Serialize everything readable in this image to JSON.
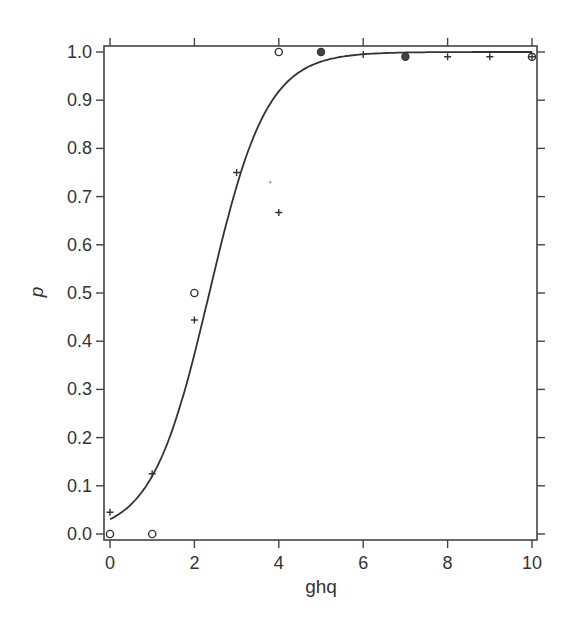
{
  "chart_data": {
    "type": "scatter",
    "title": "",
    "xlabel": "ghq",
    "ylabel": "p",
    "xlim": [
      0,
      10
    ],
    "ylim": [
      0,
      1.0
    ],
    "x_ticks": [
      0,
      2,
      4,
      6,
      8,
      10
    ],
    "x_tick_labels": [
      "0",
      "2",
      "4",
      "6",
      "8",
      "10"
    ],
    "y_ticks": [
      0.0,
      0.1,
      0.2,
      0.3,
      0.4,
      0.5,
      0.6,
      0.7,
      0.8,
      0.9,
      1.0
    ],
    "y_tick_labels": [
      "0.0",
      "0.1",
      "0.2",
      "0.3",
      "0.4",
      "0.5",
      "0.6",
      "0.7",
      "0.8",
      "0.9",
      "1.0"
    ],
    "grid": false,
    "legend": null,
    "series": [
      {
        "name": "observed-circle",
        "marker": "circle-open",
        "points": [
          [
            0,
            0.0
          ],
          [
            1,
            0.0
          ],
          [
            2,
            0.5
          ],
          [
            4,
            1.0
          ],
          [
            10,
            0.99
          ]
        ]
      },
      {
        "name": "observed-plus",
        "marker": "plus",
        "points": [
          [
            0,
            0.045
          ],
          [
            1,
            0.125
          ],
          [
            2,
            0.444
          ],
          [
            3,
            0.75
          ],
          [
            4,
            0.667
          ],
          [
            6,
            0.995
          ],
          [
            8,
            0.99
          ],
          [
            9,
            0.99
          ],
          [
            10,
            0.99
          ]
        ]
      },
      {
        "name": "observed-overlap",
        "marker": "circle-filled",
        "points": [
          [
            5,
            1.0
          ],
          [
            7,
            0.99
          ]
        ]
      },
      {
        "name": "stray-dot",
        "marker": "dot",
        "points": [
          [
            3.8,
            0.73
          ]
        ]
      },
      {
        "name": "fitted-logistic",
        "type": "line",
        "intercept": -3.46,
        "slope": 1.47,
        "x_range": [
          0,
          10
        ]
      }
    ]
  }
}
